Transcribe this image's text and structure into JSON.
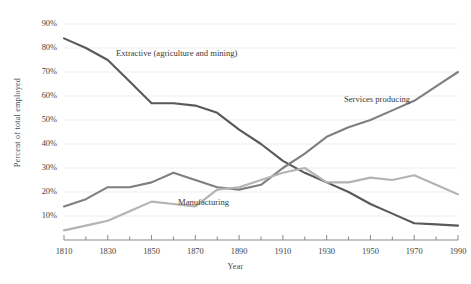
{
  "chart_data": {
    "type": "line",
    "title": "",
    "xlabel": "Year",
    "ylabel": "Percent of total employed",
    "xlim": [
      1810,
      1990
    ],
    "ylim": [
      0,
      95
    ],
    "ytick_values": [
      10,
      20,
      30,
      40,
      50,
      60,
      70,
      80,
      90
    ],
    "ytick_labels": [
      "10%",
      "20%",
      "30%",
      "40%",
      "50%",
      "60%",
      "70%",
      "80%",
      "90%"
    ],
    "xtick_values": [
      1810,
      1830,
      1850,
      1870,
      1890,
      1910,
      1930,
      1950,
      1970,
      1990
    ],
    "xtick_labels": [
      "1810",
      "1830",
      "1850",
      "1870",
      "1890",
      "1910",
      "1930",
      "1950",
      "1970",
      "1990"
    ],
    "minor_xticks": [
      1820,
      1840,
      1860,
      1880,
      1900,
      1920,
      1940,
      1960,
      1980
    ],
    "grid": "horizontal",
    "legend": "inline-annotations",
    "x": [
      1810,
      1820,
      1830,
      1840,
      1850,
      1860,
      1870,
      1880,
      1890,
      1900,
      1910,
      1920,
      1930,
      1940,
      1950,
      1960,
      1970,
      1980,
      1990
    ],
    "series": [
      {
        "name": "Extractive (agriculture and mining)",
        "color": "#595959",
        "width": 2.1,
        "values": [
          84,
          80,
          75,
          66,
          57,
          57,
          56,
          53,
          46,
          40,
          33,
          28,
          24,
          20,
          15,
          11,
          7,
          6.5,
          6
        ]
      },
      {
        "name": "Services producing",
        "color": "#7f7f7f",
        "width": 2.1,
        "values": [
          14,
          17,
          22,
          22,
          24,
          28,
          25,
          22,
          21,
          23,
          30,
          36,
          43,
          47,
          50,
          54,
          58,
          64,
          70
        ]
      },
      {
        "name": "Manufacturing",
        "color": "#b3b3b3",
        "width": 2.1,
        "values": [
          4,
          6,
          8,
          12,
          16,
          15,
          14,
          21,
          22,
          25,
          28,
          30,
          24,
          24,
          26,
          25,
          27,
          23,
          19
        ]
      }
    ],
    "annotations": [
      {
        "text": "Extractive (agriculture and mining)",
        "x": 1830,
        "y": 73
      },
      {
        "text": "Services producing",
        "x": 1935,
        "y": 53
      },
      {
        "text": "Manufacturing",
        "x": 1862,
        "y": 13
      }
    ]
  }
}
